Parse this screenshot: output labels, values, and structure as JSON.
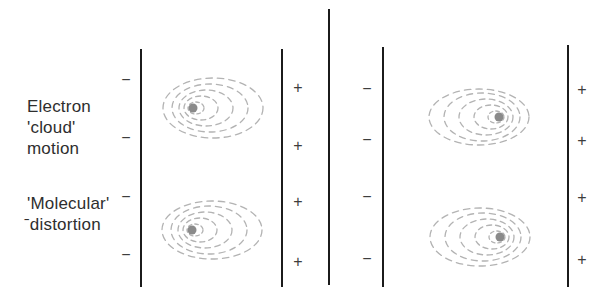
{
  "labels": {
    "electron_cloud_motion": {
      "line1": "Electron",
      "line2": "'cloud'",
      "line3": "motion"
    },
    "molecular_distortion": {
      "line1": "'Molecular'",
      "line2": "ˉdistortion"
    }
  },
  "symbols": {
    "minus": "−",
    "plus": "+"
  },
  "colors": {
    "background": "#ffffff",
    "plate": "#1b1b1b",
    "sign": "#3d3d3d",
    "text": "#2e2e2e",
    "cloud_dash": "#b3b3b3",
    "nucleus_dot": "#8a8a8a"
  }
}
